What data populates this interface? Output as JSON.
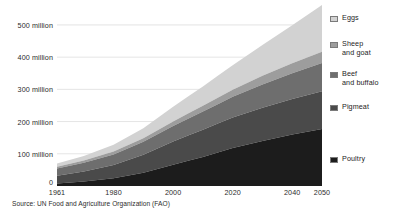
{
  "chart_data": {
    "type": "area",
    "stacked": true,
    "title": "",
    "subtitle": "",
    "xlabel": "",
    "ylabel": "",
    "xlim": [
      1961,
      2050
    ],
    "ylim": [
      0,
      565
    ],
    "y_gridlines": [
      100,
      200,
      300,
      400,
      500
    ],
    "grid": true,
    "legend_position": "right",
    "units": "million",
    "y_tick_labels": [
      "0",
      "100 million",
      "200 million",
      "300 million",
      "400 million",
      "500 million"
    ],
    "y_tick_values": [
      0,
      100,
      200,
      300,
      400,
      500
    ],
    "x_tick_labels": [
      "1961",
      "1980",
      "2000",
      "2020",
      "2040",
      "2050"
    ],
    "x_tick_values": [
      1961,
      1980,
      2000,
      2020,
      2040,
      2050
    ],
    "x": [
      1961,
      1970,
      1980,
      1990,
      2000,
      2005,
      2010,
      2015,
      2020,
      2030,
      2040,
      2050
    ],
    "series": [
      {
        "name": "Poultry",
        "color": "#1c1c1c",
        "values": [
          8,
          14,
          24,
          41,
          66,
          78,
          90,
          104,
          118,
          140,
          160,
          177
        ]
      },
      {
        "name": "Pigmeat",
        "color": "#4a4a4a",
        "values": [
          24,
          31,
          41,
          56,
          72,
          79,
          85,
          90,
          95,
          103,
          110,
          117
        ]
      },
      {
        "name": "Beef and buffalo",
        "color": "#6e6e6e",
        "values": [
          22,
          27,
          33,
          40,
          48,
          52,
          56,
          60,
          64,
          72,
          80,
          88
        ]
      },
      {
        "name": "Sheep and goat",
        "color": "#9d9d9d",
        "values": [
          6,
          7,
          9,
          11,
          14,
          16,
          18,
          20,
          22,
          27,
          31,
          35
        ]
      },
      {
        "name": "Eggs",
        "color": "#d2d2d2",
        "values": [
          10,
          14,
          21,
          31,
          46,
          53,
          60,
          68,
          76,
          96,
          118,
          145
        ]
      }
    ],
    "totals": [
      70,
      93,
      128,
      179,
      246,
      278,
      309,
      342,
      375,
      438,
      499,
      562
    ]
  },
  "legend": {
    "items": [
      {
        "label_line1": "Eggs",
        "label_line2": "",
        "swatch_color": "#d2d2d2"
      },
      {
        "label_line1": "Sheep",
        "label_line2": "and goat",
        "swatch_color": "#9d9d9d"
      },
      {
        "label_line1": "Beef",
        "label_line2": "and buffalo",
        "swatch_color": "#6e6e6e"
      },
      {
        "label_line1": "Pigmeat",
        "label_line2": "",
        "swatch_color": "#4a4a4a"
      },
      {
        "label_line1": "Poultry",
        "label_line2": "",
        "swatch_color": "#1c1c1c"
      }
    ]
  },
  "source": {
    "text": "Source: UN Food and Agriculture Organization (FAO)"
  },
  "colors": {
    "background": "#ffffff",
    "gridline": "#d8d8d8",
    "axis_text": "#2b2b2b"
  }
}
